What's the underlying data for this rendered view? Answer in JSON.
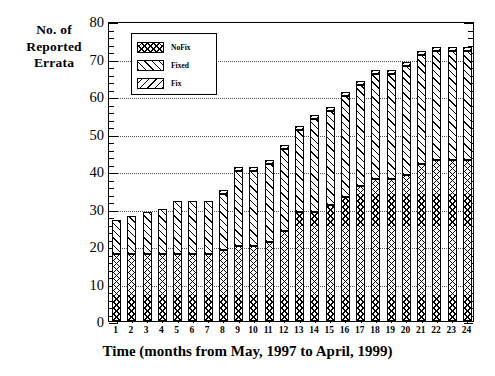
{
  "chart_data": {
    "type": "bar",
    "stacked": true,
    "title": "",
    "xlabel": "Time (months from May, 1997 to April, 1999)",
    "ylabel": "No. of\nReported\nErrata",
    "ylabel_lines": [
      "No. of",
      "Reported",
      "Errata"
    ],
    "categories": [
      "1",
      "2",
      "3",
      "4",
      "5",
      "6",
      "7",
      "8",
      "9",
      "10",
      "11",
      "12",
      "13",
      "14",
      "15",
      "16",
      "17",
      "18",
      "19",
      "20",
      "21",
      "22",
      "23",
      "24"
    ],
    "ylim": [
      0,
      80
    ],
    "ytick_values": [
      0,
      10,
      20,
      30,
      40,
      50,
      60,
      70,
      80
    ],
    "ytick_labels": [
      "0",
      "10",
      "20",
      "30",
      "40",
      "50",
      "60",
      "70",
      "80"
    ],
    "y_minor_step": 2,
    "grid": "horizontal-dotted",
    "legend_position": "top-left-inside",
    "series": [
      {
        "name": "NoFix",
        "pattern": "crosshatch",
        "values": [
          18,
          18,
          18,
          18,
          18,
          18,
          18,
          19,
          20,
          20,
          21,
          24,
          29,
          29,
          31,
          33,
          36,
          38,
          38,
          39,
          42,
          43,
          43,
          43
        ]
      },
      {
        "name": "Fixed",
        "pattern": "forward-diagonal",
        "values": [
          9,
          10,
          11,
          12,
          14,
          14,
          14,
          15,
          20,
          20,
          21,
          22,
          22,
          25,
          25,
          27,
          27,
          28,
          28,
          29,
          29,
          29,
          29,
          29
        ]
      },
      {
        "name": "Fix",
        "pattern": "back-diagonal",
        "values": [
          0,
          0,
          0,
          0,
          0,
          0,
          0,
          1,
          1,
          1,
          1,
          1,
          1,
          1,
          1,
          1,
          1,
          1,
          1,
          1,
          1,
          1,
          1,
          1
        ]
      }
    ],
    "totals": [
      27,
      28,
      29,
      30,
      32,
      32,
      32,
      35,
      41,
      41,
      43,
      47,
      52,
      55,
      57,
      61,
      64,
      67,
      67,
      69,
      72,
      73,
      73,
      73
    ]
  },
  "legend": {
    "entries": [
      {
        "label": "NoFix"
      },
      {
        "label": "Fixed"
      },
      {
        "label": "Fix"
      }
    ]
  },
  "colors": {
    "axis": "#000000",
    "grid": "#555555",
    "background": "#ffffff",
    "bar_outline": "#000000"
  }
}
